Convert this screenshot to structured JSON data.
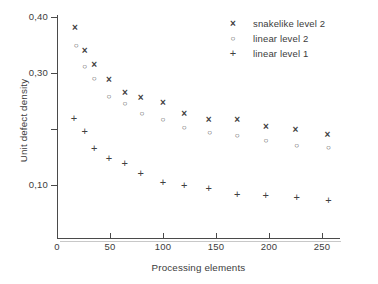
{
  "chart_data": {
    "type": "scatter",
    "title": "",
    "xlabel": "Processing elements",
    "ylabel": "Unit defect density",
    "xlim": [
      0,
      267
    ],
    "ylim": [
      0,
      0.425
    ],
    "grid": false,
    "legend_position": "top-right",
    "decimal_separator": ",",
    "x_ticks": [
      {
        "value": 0,
        "label": "0"
      },
      {
        "value": 50,
        "label": "50"
      },
      {
        "value": 100,
        "label": "100"
      },
      {
        "value": 150,
        "label": "150"
      },
      {
        "value": 200,
        "label": "200"
      },
      {
        "value": 250,
        "label": "250"
      }
    ],
    "y_ticks": [
      {
        "value": 0.4,
        "label": "0,40"
      },
      {
        "value": 0.3,
        "label": "0,30"
      },
      {
        "value": 0.2,
        "label": ""
      },
      {
        "value": 0.1,
        "label": "0,10"
      }
    ],
    "series": [
      {
        "name": "snakelike level 2",
        "marker": "x",
        "color": "#404040",
        "points": [
          {
            "x": 17,
            "y": 0.381
          },
          {
            "x": 26,
            "y": 0.34
          },
          {
            "x": 35,
            "y": 0.316
          },
          {
            "x": 49,
            "y": 0.289
          },
          {
            "x": 64,
            "y": 0.266
          },
          {
            "x": 79,
            "y": 0.256
          },
          {
            "x": 100,
            "y": 0.248
          },
          {
            "x": 120,
            "y": 0.228
          },
          {
            "x": 143,
            "y": 0.217
          },
          {
            "x": 170,
            "y": 0.217
          },
          {
            "x": 197,
            "y": 0.204
          },
          {
            "x": 225,
            "y": 0.199
          },
          {
            "x": 255,
            "y": 0.19
          }
        ]
      },
      {
        "name": "linear level 2",
        "marker": "o",
        "color": "#404040",
        "points": [
          {
            "x": 18,
            "y": 0.35
          },
          {
            "x": 26,
            "y": 0.311
          },
          {
            "x": 35,
            "y": 0.29
          },
          {
            "x": 49,
            "y": 0.259
          },
          {
            "x": 64,
            "y": 0.245
          },
          {
            "x": 80,
            "y": 0.228
          },
          {
            "x": 100,
            "y": 0.217
          },
          {
            "x": 120,
            "y": 0.203
          },
          {
            "x": 144,
            "y": 0.194
          },
          {
            "x": 170,
            "y": 0.188
          },
          {
            "x": 197,
            "y": 0.179
          },
          {
            "x": 226,
            "y": 0.171
          },
          {
            "x": 256,
            "y": 0.167
          }
        ]
      },
      {
        "name": "linear level 1",
        "marker": "+",
        "color": "#404040",
        "points": [
          {
            "x": 16,
            "y": 0.218
          },
          {
            "x": 26,
            "y": 0.195
          },
          {
            "x": 35,
            "y": 0.165
          },
          {
            "x": 49,
            "y": 0.147
          },
          {
            "x": 64,
            "y": 0.139
          },
          {
            "x": 79,
            "y": 0.121
          },
          {
            "x": 100,
            "y": 0.105
          },
          {
            "x": 120,
            "y": 0.099
          },
          {
            "x": 143,
            "y": 0.093
          },
          {
            "x": 170,
            "y": 0.084
          },
          {
            "x": 197,
            "y": 0.081
          },
          {
            "x": 226,
            "y": 0.078
          },
          {
            "x": 256,
            "y": 0.072
          }
        ]
      }
    ]
  },
  "legend": {
    "entries": [
      {
        "symbol": "×",
        "label": "snakelike level 2"
      },
      {
        "symbol": "○",
        "label": "linear level 2"
      },
      {
        "symbol": "+",
        "label": "linear level 1"
      }
    ]
  },
  "page": {
    "caption_fragment": ""
  }
}
